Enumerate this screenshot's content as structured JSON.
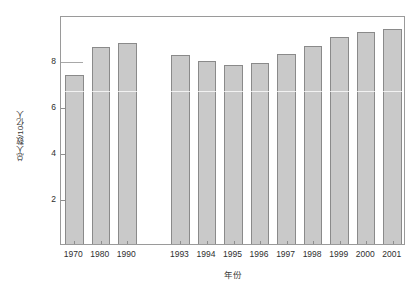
{
  "chart_data": {
    "type": "bar",
    "title": "",
    "xlabel": "年份",
    "ylabel": "总人数/10亿人",
    "categories": [
      "1970",
      "1980",
      "1990",
      "",
      "1993",
      "1994",
      "1995",
      "1996",
      "1997",
      "1998",
      "1999",
      "2000",
      "2001"
    ],
    "values": [
      7.35,
      8.55,
      8.75,
      null,
      8.2,
      7.95,
      7.8,
      7.88,
      8.25,
      8.6,
      9.0,
      9.2,
      9.35
    ],
    "ylim": [
      0,
      9.95
    ],
    "yticks": [
      2,
      4,
      6,
      8
    ],
    "ytick_labels": [
      "2",
      "4",
      "6",
      "8"
    ],
    "grid": false,
    "legend": null,
    "bar_color": "#c9c9c9",
    "bar_edge_color": "#8a8a8a",
    "axis_color": "#9a9a9a",
    "text_color": "#2e2e2e",
    "background": "#ffffff",
    "gap_after_index": 2
  },
  "series_points": [
    {
      "category": "1970",
      "value": 7.35
    },
    {
      "category": "1980",
      "value": 8.55
    },
    {
      "category": "1990",
      "value": 8.75
    },
    {
      "category": "1993",
      "value": 8.2
    },
    {
      "category": "1994",
      "value": 7.95
    },
    {
      "category": "1995",
      "value": 7.8
    },
    {
      "category": "1996",
      "value": 7.88
    },
    {
      "category": "1997",
      "value": 8.25
    },
    {
      "category": "1998",
      "value": 8.6
    },
    {
      "category": "1999",
      "value": 9.0
    },
    {
      "category": "2000",
      "value": 9.2
    },
    {
      "category": "2001",
      "value": 9.35
    }
  ]
}
